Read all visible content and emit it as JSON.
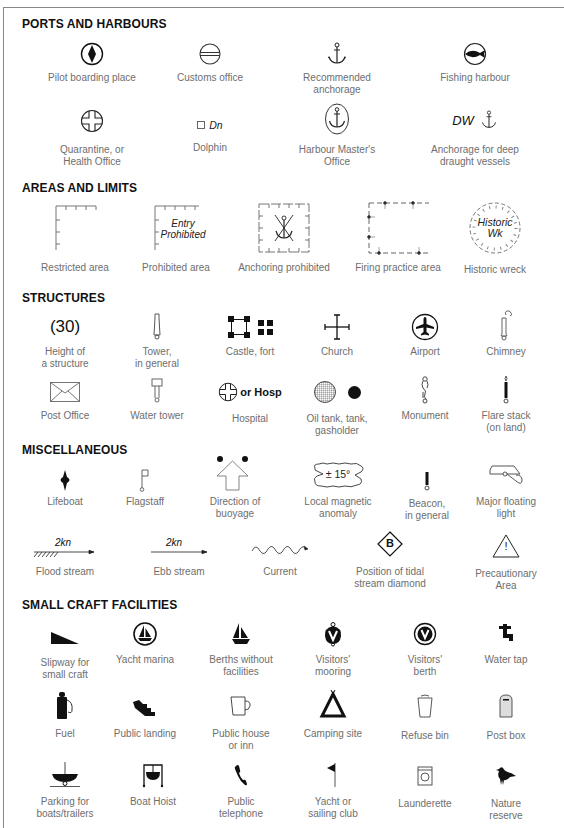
{
  "sections": [
    {
      "title": "PORTS AND HARBOURS",
      "items": [
        {
          "icon": "pilot-boarding-icon",
          "label": "Pilot boarding place"
        },
        {
          "icon": "customs-office-icon",
          "label": "Customs office"
        },
        {
          "icon": "anchor-icon",
          "label": "Recommended anchorage"
        },
        {
          "icon": "fish-icon",
          "label": "Fishing harbour"
        },
        {
          "icon": "quarantine-icon",
          "label": "Quarantine, or\nHealth Office"
        },
        {
          "icon": "dolphin-icon",
          "label": "Dolphin",
          "icon_text": "Dn"
        },
        {
          "icon": "harbour-master-icon",
          "label": "Harbour Master's\nOffice"
        },
        {
          "icon": "deep-anchorage-icon",
          "label": "Anchorage for deep\ndraught vessels",
          "icon_text": "DW"
        }
      ]
    },
    {
      "title": "AREAS AND LIMITS",
      "items": [
        {
          "icon": "restricted-area-icon",
          "label": "Restricted area"
        },
        {
          "icon": "prohibited-area-icon",
          "label": "Prohibited area",
          "icon_text": "Entry\nProhibited"
        },
        {
          "icon": "anchoring-prohibited-icon",
          "label": "Anchoring prohibited"
        },
        {
          "icon": "firing-practice-icon",
          "label": "Firing practice area"
        },
        {
          "icon": "historic-wreck-icon",
          "label": "Historic wreck",
          "icon_text": "Historic\nWk"
        }
      ]
    },
    {
      "title": "STRUCTURES",
      "items": [
        {
          "icon": "height-icon",
          "label": "Height of\na structure",
          "icon_text": "(30)"
        },
        {
          "icon": "tower-icon",
          "label": "Tower,\nin general"
        },
        {
          "icon": "castle-icon",
          "label": "Castle, fort"
        },
        {
          "icon": "church-icon",
          "label": "Church"
        },
        {
          "icon": "airport-icon",
          "label": "Airport"
        },
        {
          "icon": "chimney-icon",
          "label": "Chimney"
        },
        {
          "icon": "envelope-icon",
          "label": "Post Office"
        },
        {
          "icon": "water-tower-icon",
          "label": "Water tower"
        },
        {
          "icon": "hospital-icon",
          "label": "Hospital",
          "icon_text": "or Hosp"
        },
        {
          "icon": "tank-icon",
          "label": "Oil tank, tank,\ngasholder"
        },
        {
          "icon": "monument-icon",
          "label": "Monument"
        },
        {
          "icon": "flare-stack-icon",
          "label": "Flare stack\n(on land)"
        }
      ]
    },
    {
      "title": "MISCELLANEOUS",
      "items": [
        {
          "icon": "lifeboat-icon",
          "label": "Lifeboat"
        },
        {
          "icon": "flagstaff-icon",
          "label": "Flagstaff"
        },
        {
          "icon": "buoyage-direction-icon",
          "label": "Direction of\nbuoyage"
        },
        {
          "icon": "magnetic-anomaly-icon",
          "label": "Local magnetic\nanomaly",
          "icon_text": "± 15°"
        },
        {
          "icon": "beacon-icon",
          "label": "Beacon,\nin general"
        },
        {
          "icon": "floating-light-icon",
          "label": "Major floating\nlight"
        },
        {
          "icon": "flood-stream-icon",
          "label": "Flood stream",
          "icon_text": "2kn"
        },
        {
          "icon": "ebb-stream-icon",
          "label": "Ebb stream",
          "icon_text": "2kn"
        },
        {
          "icon": "current-icon",
          "label": "Current"
        },
        {
          "icon": "tidal-diamond-icon",
          "label": "Position of tidal\nstream diamond",
          "icon_text": "B"
        },
        {
          "icon": "warning-triangle-icon",
          "label": "Precautionary\nArea",
          "icon_text": "!"
        }
      ]
    },
    {
      "title": "SMALL CRAFT FACILITIES",
      "items": [
        {
          "icon": "slipway-icon",
          "label": "Slipway for\nsmall craft"
        },
        {
          "icon": "yacht-marina-icon",
          "label": "Yacht marina"
        },
        {
          "icon": "sailboat-icon",
          "label": "Berths without\nfacilities"
        },
        {
          "icon": "visitors-mooring-icon",
          "label": "Visitors'\nmooring",
          "icon_text": "V"
        },
        {
          "icon": "visitors-berth-icon",
          "label": "Visitors'\nberth",
          "icon_text": "V"
        },
        {
          "icon": "water-tap-icon",
          "label": "Water tap"
        },
        {
          "icon": "fuel-icon",
          "label": "Fuel"
        },
        {
          "icon": "stairs-icon",
          "label": "Public landing"
        },
        {
          "icon": "beer-mug-icon",
          "label": "Public house\nor inn"
        },
        {
          "icon": "tent-icon",
          "label": "Camping site"
        },
        {
          "icon": "bin-icon",
          "label": "Refuse bin"
        },
        {
          "icon": "post-box-icon",
          "label": "Post box"
        },
        {
          "icon": "boat-trailer-icon",
          "label": "Parking for\nboats/trailers"
        },
        {
          "icon": "boat-hoist-icon",
          "label": "Boat Hoist"
        },
        {
          "icon": "telephone-icon",
          "label": "Public\ntelephone"
        },
        {
          "icon": "pennant-icon",
          "label": "Yacht or\nsailing club"
        },
        {
          "icon": "washing-machine-icon",
          "label": "Launderette"
        },
        {
          "icon": "bird-icon",
          "label": "Nature\nreserve"
        }
      ]
    }
  ]
}
